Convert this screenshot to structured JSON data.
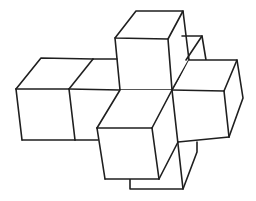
{
  "figure": {
    "stroke_color": "#1f1f1f",
    "background_color": "#ffffff",
    "cubes": [
      {
        "id": "top",
        "label": "top-cube"
      },
      {
        "id": "left-outer",
        "label": "left-outer-cube"
      },
      {
        "id": "left-inner",
        "label": "left-inner-cube"
      },
      {
        "id": "center",
        "label": "center-cube"
      },
      {
        "id": "right",
        "label": "right-cube"
      },
      {
        "id": "back",
        "label": "back-cube"
      },
      {
        "id": "front",
        "label": "front-cube"
      },
      {
        "id": "bottom",
        "label": "bottom-cube"
      }
    ]
  }
}
